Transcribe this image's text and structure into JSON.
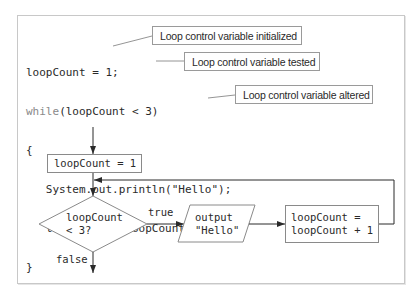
{
  "code": {
    "lines": [
      {
        "text": "loopCount = 1;"
      },
      {
        "keyword": "while",
        "text": "(loopCount < 3)"
      },
      {
        "text": "{"
      },
      {
        "text": "   System.out.println(\"Hello\");"
      },
      {
        "text": "   loopCount = loopCount + 1;"
      },
      {
        "text": "}"
      }
    ]
  },
  "callouts": {
    "initialized": "Loop control variable initialized",
    "tested": "Loop control variable tested",
    "altered": "Loop control variable altered"
  },
  "flowchart": {
    "init_box": "loopCount = 1",
    "decision_line1": "loopCount",
    "decision_line2": "< 3?",
    "true_label": "true",
    "false_label": "false",
    "output_line1": "output",
    "output_line2": "\"Hello\"",
    "increment_line1": "loopCount =",
    "increment_line2": "loopCount + 1"
  },
  "colors": {
    "line": "#3a3a3a",
    "shape_border": "#8a8a8a",
    "frame_border": "#c8c8c8",
    "keyword": "#8a8a8a"
  }
}
